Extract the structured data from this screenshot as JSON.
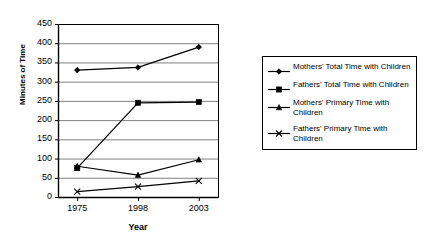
{
  "chart_data": {
    "type": "line",
    "title": "",
    "xlabel": "Year",
    "ylabel": "Minutes of Time",
    "categories": [
      "1975",
      "1998",
      "2003"
    ],
    "ylim": [
      0,
      450
    ],
    "ytick_step": 50,
    "yticks": [
      0,
      50,
      100,
      150,
      200,
      250,
      300,
      350,
      400,
      450
    ],
    "ytick_labels": [
      "0",
      "50",
      "100",
      "150",
      "200",
      "250",
      "300",
      "350",
      "400",
      "450"
    ],
    "grid": true,
    "grid_axis": "y",
    "legend_position": "right",
    "series": [
      {
        "name": "Mothers' Total Time with Children",
        "marker": "diamond",
        "color": "#000000",
        "values": [
          330,
          337,
          390
        ]
      },
      {
        "name": "Fathers' Total Time with Children",
        "marker": "square",
        "color": "#000000",
        "values": [
          75,
          245,
          247
        ]
      },
      {
        "name": "Mothers' Primary Time with Children",
        "marker": "triangle",
        "color": "#000000",
        "values": [
          80,
          57,
          97
        ]
      },
      {
        "name": "Fathers' Primary Time with Children",
        "marker": "x",
        "color": "#000000",
        "values": [
          14,
          27,
          42
        ]
      }
    ]
  },
  "legend": {
    "items": [
      {
        "label": "Mothers' Total Time with Children",
        "marker": "diamond"
      },
      {
        "label": "Fathers' Total Time with Children",
        "marker": "square"
      },
      {
        "label": "Mothers' Primary Time with Children",
        "marker": "triangle"
      },
      {
        "label": "Fathers' Primary Time with Children",
        "marker": "x"
      }
    ]
  },
  "style": {
    "axis_color": "#000000",
    "grid_color": "#808080",
    "plot_background": "#ffffff"
  }
}
